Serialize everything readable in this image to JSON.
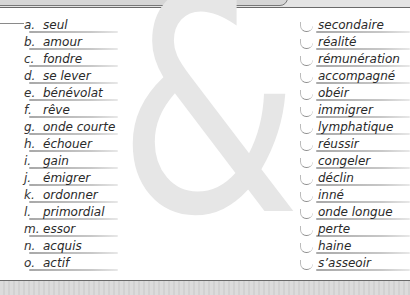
{
  "decor": {
    "ampersand": "&"
  },
  "left_column": {
    "items": [
      {
        "letter": "a.",
        "word": "seul"
      },
      {
        "letter": "b.",
        "word": "amour"
      },
      {
        "letter": "c.",
        "word": "fondre"
      },
      {
        "letter": "d.",
        "word": "se lever"
      },
      {
        "letter": "e.",
        "word": "bénévolat"
      },
      {
        "letter": "f.",
        "word": "rêve"
      },
      {
        "letter": "g.",
        "word": "onde courte"
      },
      {
        "letter": "h.",
        "word": "échouer"
      },
      {
        "letter": "i.",
        "word": "gain"
      },
      {
        "letter": "j.",
        "word": "émigrer"
      },
      {
        "letter": "k.",
        "word": "ordonner"
      },
      {
        "letter": "l.",
        "word": "primordial"
      },
      {
        "letter": "m.",
        "word": "essor"
      },
      {
        "letter": "n.",
        "word": "acquis"
      },
      {
        "letter": "o.",
        "word": "actif"
      }
    ]
  },
  "right_column": {
    "items": [
      {
        "word": "secondaire"
      },
      {
        "word": "réalité"
      },
      {
        "word": "rémunération"
      },
      {
        "word": "accompagné"
      },
      {
        "word": "obéir"
      },
      {
        "word": "immigrer"
      },
      {
        "word": "lymphatique"
      },
      {
        "word": "réussir"
      },
      {
        "word": "congeler"
      },
      {
        "word": "déclin"
      },
      {
        "word": "inné"
      },
      {
        "word": "onde longue"
      },
      {
        "word": "perte"
      },
      {
        "word": "haine"
      },
      {
        "word": "s’asseoir"
      }
    ]
  }
}
